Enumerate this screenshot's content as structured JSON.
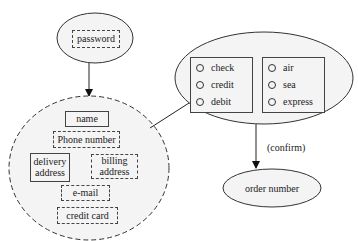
{
  "diagram": {
    "password_node": {
      "field": "password"
    },
    "customer_node": {
      "fields": {
        "name": "name",
        "phone": "Phone number",
        "delivery": "delivery address",
        "delivery_line1": "delivery",
        "delivery_line2": "address",
        "billing_line1": "billing",
        "billing_line2": "address",
        "email": "e-mail",
        "credit_card": "credit card"
      }
    },
    "options_node": {
      "payment_group": [
        "check",
        "credit",
        "debit"
      ],
      "shipping_group": [
        "air",
        "sea",
        "express"
      ]
    },
    "edge_label_confirm": "(confirm)",
    "order_node": {
      "label": "order number"
    },
    "colors": {
      "stroke": "#333333",
      "fill": "#f4f4f4",
      "background": "#ffffff"
    }
  }
}
